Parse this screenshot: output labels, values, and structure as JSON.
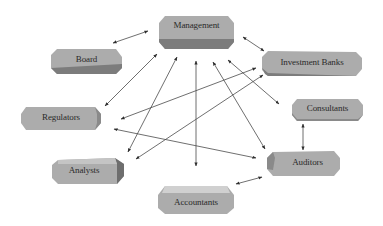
{
  "diagram": {
    "type": "stakeholder-relationship-network",
    "colors": {
      "box_face": "#acacac",
      "box_top": "#c4c4c4",
      "box_side": "#7c7c7c",
      "arrow": "#3a3a3a",
      "text": "#2a2a2a"
    },
    "nodes": [
      {
        "id": "management",
        "label": "Management"
      },
      {
        "id": "board",
        "label": "Board"
      },
      {
        "id": "investment_banks",
        "label": "Investment Banks"
      },
      {
        "id": "consultants",
        "label": "Consultants"
      },
      {
        "id": "regulators",
        "label": "Regulators"
      },
      {
        "id": "analysts",
        "label": "Analysts"
      },
      {
        "id": "auditors",
        "label": "Auditors"
      },
      {
        "id": "accountants",
        "label": "Accountants"
      }
    ],
    "edges": [
      {
        "from": "board",
        "to": "management",
        "direction": "both"
      },
      {
        "from": "management",
        "to": "investment_banks",
        "direction": "both"
      },
      {
        "from": "management",
        "to": "regulators",
        "direction": "both"
      },
      {
        "from": "management",
        "to": "analysts",
        "direction": "both"
      },
      {
        "from": "management",
        "to": "accountants",
        "direction": "both"
      },
      {
        "from": "management",
        "to": "auditors",
        "direction": "both"
      },
      {
        "from": "management",
        "to": "consultants",
        "direction": "both"
      },
      {
        "from": "investment_banks",
        "to": "regulators",
        "direction": "both"
      },
      {
        "from": "investment_banks",
        "to": "analysts",
        "direction": "both"
      },
      {
        "from": "regulators",
        "to": "auditors",
        "direction": "both"
      },
      {
        "from": "consultants",
        "to": "auditors",
        "direction": "both"
      },
      {
        "from": "accountants",
        "to": "auditors",
        "direction": "both"
      }
    ]
  }
}
